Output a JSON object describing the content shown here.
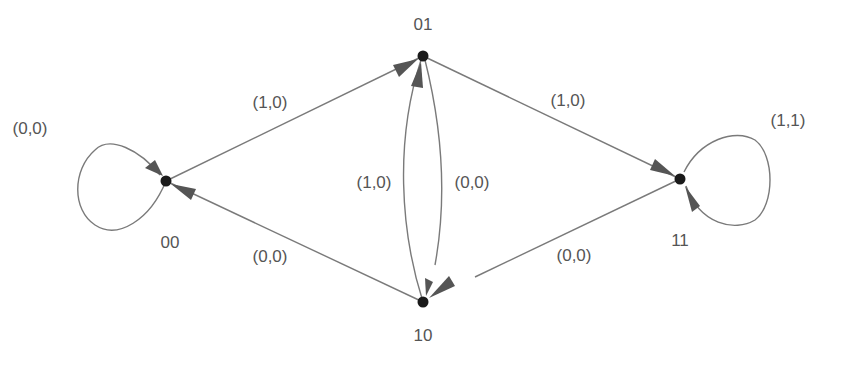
{
  "diagram": {
    "type": "state-transition-graph",
    "nodes": [
      {
        "id": "00",
        "label": "00",
        "x": 166,
        "y": 181,
        "label_x": 170,
        "label_y": 248
      },
      {
        "id": "01",
        "label": "01",
        "x": 423,
        "y": 56,
        "label_x": 423,
        "label_y": 30
      },
      {
        "id": "11",
        "label": "11",
        "x": 680,
        "y": 179,
        "label_x": 680,
        "label_y": 246
      },
      {
        "id": "10",
        "label": "10",
        "x": 423,
        "y": 302,
        "label_x": 423,
        "label_y": 341
      }
    ],
    "edges": [
      {
        "from": "00",
        "to": "00",
        "label": "(0,0)",
        "label_x": 30,
        "label_y": 134
      },
      {
        "from": "00",
        "to": "01",
        "label": "(1,0)",
        "label_x": 270,
        "label_y": 108
      },
      {
        "from": "01",
        "to": "11",
        "label": "(1,0)",
        "label_x": 568,
        "label_y": 106
      },
      {
        "from": "11",
        "to": "11",
        "label": "(1,1)",
        "label_x": 788,
        "label_y": 126
      },
      {
        "from": "10",
        "to": "01",
        "label": "(1,0)",
        "label_x": 374,
        "label_y": 188
      },
      {
        "from": "01",
        "to": "10",
        "label": "(0,0)",
        "label_x": 472,
        "label_y": 188
      },
      {
        "from": "10",
        "to": "00",
        "label": "(0,0)",
        "label_x": 270,
        "label_y": 262
      },
      {
        "from": "11",
        "to": "10",
        "label": "(0,0)",
        "label_x": 574,
        "label_y": 261
      }
    ]
  },
  "labels": {
    "node_00": "00",
    "node_01": "01",
    "node_11": "11",
    "node_10": "10",
    "edge_00_00": "(0,0)",
    "edge_00_01": "(1,0)",
    "edge_01_11": "(1,0)",
    "edge_11_11": "(1,1)",
    "edge_10_01": "(1,0)",
    "edge_01_10": "(0,0)",
    "edge_10_00": "(0,0)",
    "edge_11_10": "(0,0)"
  },
  "colors": {
    "edge": "#7a7a7a",
    "arrowhead": "#555555",
    "node": "#1a1a1a",
    "text": "#555555"
  }
}
